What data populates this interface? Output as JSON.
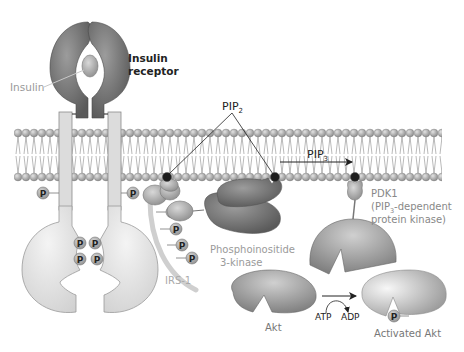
{
  "labels": {
    "insulin": "Insulin",
    "insulin_receptor_line1": "Insulin",
    "insulin_receptor_line2": "receptor",
    "pip2": "PIP",
    "pip2_sub": "2",
    "pip3": "PIP",
    "pip3_sub": "3",
    "pdk1_line1": "PDK1",
    "pdk1_line2_pre": "(PIP",
    "pdk1_line2_sub": "3",
    "pdk1_line2_post": "-dependent",
    "pdk1_line3": "protein kinase)",
    "pi3k_line1": "Phosphoinositide",
    "pi3k_line2": "3-kinase",
    "irs1": "IRS-1",
    "akt": "Akt",
    "atp": "ATP",
    "adp": "ADP",
    "activated_akt": "Activated Akt",
    "phosphate": "P"
  },
  "colors": {
    "dark_protein": "#6e6e6e",
    "mid_protein": "#9a9a9a",
    "light_protein": "#d4d4d4",
    "label_gray": "#9a9a9a",
    "label_dark": "#222222",
    "membrane_head": "#a8a8a8",
    "pip_head": "#1e1e1e"
  }
}
